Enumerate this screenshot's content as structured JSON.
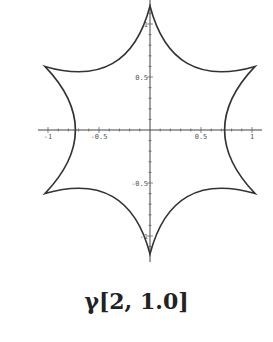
{
  "caption": "γ[2, 1.0]",
  "chart_data": {
    "type": "line",
    "title": "γ[2, 1.0]",
    "xlabel": "",
    "ylabel": "",
    "xlim": [
      -1.1,
      1.1
    ],
    "ylim": [
      -1.2,
      1.2
    ],
    "grid": false,
    "legend": null,
    "x_ticks": [
      -1,
      -0.5,
      0.5,
      1
    ],
    "x_tick_labels": [
      "-1",
      "-0.5",
      "0.5",
      "1"
    ],
    "y_ticks": [
      -1,
      -0.5,
      0.5,
      1
    ],
    "y_tick_labels": [
      "-1",
      "-0.5",
      "0.5",
      "1"
    ],
    "cusps": [
      {
        "x": 0,
        "y": 1.17
      },
      {
        "x": 1.03,
        "y": 0.6
      },
      {
        "x": 1.03,
        "y": -0.6
      },
      {
        "x": 0,
        "y": -1.17
      },
      {
        "x": -1.03,
        "y": -0.6
      },
      {
        "x": -1.03,
        "y": 0.6
      }
    ],
    "x_axis_crossings": [
      -0.8,
      0.8
    ],
    "y_axis_crossings": [
      -1.17,
      1.17
    ]
  }
}
